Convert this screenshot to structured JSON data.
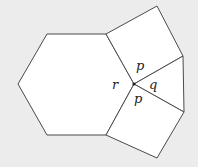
{
  "diagram": {
    "type": "vertex-configuration",
    "colors": {
      "background": "#ececec",
      "fill": "#ffffff",
      "stroke": "#4a4a4a",
      "text": "#222222"
    },
    "shapes": {
      "hexagon": "18,84 47,34 106,34 134,84 106,135 47,135",
      "upper_square": "106,34 157,6 183,56 134,84",
      "triangle": "134,84 183,56 184,112",
      "lower_square": "134,84 184,112 157,158 106,135"
    },
    "vertex": {
      "x": 134,
      "y": 84
    },
    "labels": {
      "upper_p": "p",
      "lower_p": "p",
      "q": "q",
      "r": "r"
    }
  }
}
